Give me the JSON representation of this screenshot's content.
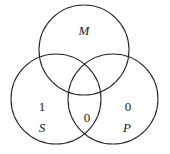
{
  "diagram": {
    "type": "venn",
    "sets": [
      {
        "name": "M",
        "cx": 84,
        "cy": 50,
        "r": 45
      },
      {
        "name": "S",
        "cx": 56,
        "cy": 99,
        "r": 45
      },
      {
        "name": "P",
        "cx": 113,
        "cy": 99,
        "r": 45
      }
    ],
    "labels": {
      "M": "M",
      "S": "S",
      "P": "P"
    },
    "region_values": {
      "S_only": "1",
      "S_and_P": "0",
      "P_only": "0"
    }
  }
}
